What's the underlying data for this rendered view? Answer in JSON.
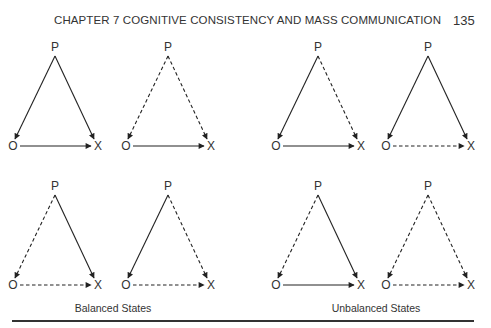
{
  "header": {
    "title": "CHAPTER 7   COGNITIVE CONSISTENCY AND MASS COMMUNICATION",
    "page_number": "135"
  },
  "nodes": {
    "p": "P",
    "o": "O",
    "x": "X"
  },
  "captions": {
    "balanced": "Balanced States",
    "unbalanced": "Unbalanced States"
  },
  "legend_note": {
    "solid": "positive relation",
    "dashed": "negative relation"
  },
  "diagrams": [
    {
      "group": "balanced",
      "row": 1,
      "P_O": "solid",
      "P_X": "solid",
      "O_X": "solid"
    },
    {
      "group": "balanced",
      "row": 1,
      "P_O": "dashed",
      "P_X": "dashed",
      "O_X": "solid"
    },
    {
      "group": "unbalanced",
      "row": 1,
      "P_O": "solid",
      "P_X": "dashed",
      "O_X": "solid"
    },
    {
      "group": "unbalanced",
      "row": 1,
      "P_O": "solid",
      "P_X": "solid",
      "O_X": "dashed"
    },
    {
      "group": "balanced",
      "row": 2,
      "P_O": "dashed",
      "P_X": "solid",
      "O_X": "dashed"
    },
    {
      "group": "balanced",
      "row": 2,
      "P_O": "solid",
      "P_X": "dashed",
      "O_X": "dashed"
    },
    {
      "group": "unbalanced",
      "row": 2,
      "P_O": "dashed",
      "P_X": "solid",
      "O_X": "solid"
    },
    {
      "group": "unbalanced",
      "row": 2,
      "P_O": "dashed",
      "P_X": "dashed",
      "O_X": "dashed"
    }
  ]
}
